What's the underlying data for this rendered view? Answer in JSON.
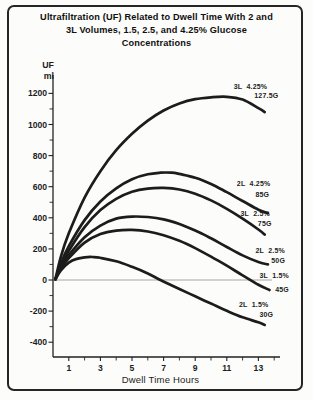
{
  "figure": {
    "title_lines": [
      "Ultrafiltration (UF) Related to Dwell Time With 2 and",
      "3L Volumes, 1.5, 2.5, and 4.25% Glucose",
      "Concentrations"
    ]
  },
  "chart_data": {
    "type": "line",
    "title": "Ultrafiltration (UF) Related to Dwell Time With 2 and 3L Volumes, 1.5, 2.5, and 4.25% Glucose Concentrations",
    "xlabel": "Dwell Time Hours",
    "ylabel": "UF ml",
    "ylabel_lines": [
      "UF",
      "ml"
    ],
    "xlim": [
      0,
      14.5
    ],
    "ylim": [
      -500,
      1320
    ],
    "x_major_ticks": [
      1,
      3,
      5,
      7,
      9,
      11,
      13
    ],
    "x_minor_ticks": [
      2,
      4,
      6,
      8,
      10,
      12,
      14
    ],
    "y_major_ticks": [
      1200,
      1000,
      800,
      600,
      400,
      200,
      0,
      -200,
      -400
    ],
    "y_minor_ticks": [
      1100,
      900,
      700,
      500,
      300,
      100,
      -100,
      -300
    ],
    "grid": false,
    "zero_line": true,
    "legend_position": "inline-labels",
    "colors": {
      "curve": "#1c1c1c",
      "axis": "#222222",
      "zero_line": "#8f8f8f",
      "text": "#1d1d1d",
      "background": "#fcfcfa"
    },
    "series": [
      {
        "id": "3l-4-25",
        "name": "3L 4.25% (127.5G)",
        "volume": "3L",
        "glucose_pct": "4.25%",
        "glucose_load": "127.5G",
        "label_lines": [
          "3L  4.25%",
          "127.5G"
        ],
        "label_pos": [
          [
            12.5,
            1245
          ],
          [
            13.5,
            1185
          ]
        ],
        "points": [
          [
            0.15,
            5
          ],
          [
            0.5,
            150
          ],
          [
            1,
            300
          ],
          [
            2,
            530
          ],
          [
            3,
            700
          ],
          [
            4,
            835
          ],
          [
            5,
            940
          ],
          [
            6,
            1025
          ],
          [
            7,
            1090
          ],
          [
            8,
            1135
          ],
          [
            9,
            1163
          ],
          [
            10,
            1175
          ],
          [
            11,
            1178
          ],
          [
            12,
            1160
          ],
          [
            13,
            1105
          ],
          [
            13.4,
            1080
          ]
        ]
      },
      {
        "id": "2l-4-25",
        "name": "2L 4.25% (85G)",
        "volume": "2L",
        "glucose_pct": "4.25%",
        "glucose_load": "85G",
        "label_lines": [
          "2L  4.25%",
          "85G"
        ],
        "label_pos": [
          [
            12.7,
            623
          ],
          [
            13.25,
            553
          ]
        ],
        "points": [
          [
            0.15,
            5
          ],
          [
            0.5,
            108
          ],
          [
            1,
            218
          ],
          [
            2,
            385
          ],
          [
            3,
            505
          ],
          [
            4,
            590
          ],
          [
            5,
            648
          ],
          [
            6,
            680
          ],
          [
            6.8,
            690
          ],
          [
            7.5,
            690
          ],
          [
            8,
            682
          ],
          [
            9,
            658
          ],
          [
            10,
            618
          ],
          [
            11,
            565
          ],
          [
            12,
            508
          ],
          [
            13,
            452
          ],
          [
            13.6,
            430
          ]
        ]
      },
      {
        "id": "3l-2-5",
        "name": "3L 2.5% (75G)",
        "volume": "3L",
        "glucose_pct": "2.5%",
        "glucose_load": "75G",
        "label_lines": [
          "3L  2.5%",
          "75G"
        ],
        "label_pos": [
          [
            12.8,
            430
          ],
          [
            13.4,
            364
          ]
        ],
        "points": [
          [
            0.15,
            5
          ],
          [
            0.5,
            92
          ],
          [
            1,
            188
          ],
          [
            2,
            340
          ],
          [
            3,
            450
          ],
          [
            4,
            522
          ],
          [
            5,
            568
          ],
          [
            6,
            588
          ],
          [
            7,
            592
          ],
          [
            8,
            582
          ],
          [
            9,
            555
          ],
          [
            10,
            512
          ],
          [
            11,
            458
          ],
          [
            12,
            395
          ],
          [
            13,
            325
          ],
          [
            13.4,
            292
          ]
        ]
      },
      {
        "id": "2l-2-5",
        "name": "2L 2.5% (50G)",
        "volume": "2L",
        "glucose_pct": "2.5%",
        "glucose_load": "50G",
        "label_lines": [
          "2L  2.5%",
          "50G"
        ],
        "label_pos": [
          [
            13.75,
            187
          ],
          [
            14.25,
            126
          ]
        ],
        "points": [
          [
            0.15,
            5
          ],
          [
            0.5,
            82
          ],
          [
            1,
            160
          ],
          [
            2,
            275
          ],
          [
            3,
            350
          ],
          [
            4,
            395
          ],
          [
            5,
            408
          ],
          [
            6,
            405
          ],
          [
            7,
            390
          ],
          [
            8,
            360
          ],
          [
            9,
            318
          ],
          [
            10,
            268
          ],
          [
            11,
            212
          ],
          [
            12,
            158
          ],
          [
            13,
            115
          ],
          [
            13.6,
            100
          ]
        ]
      },
      {
        "id": "3l-1-5",
        "name": "3L 1.5% (45G)",
        "volume": "3L",
        "glucose_pct": "1.5%",
        "glucose_load": "45G",
        "label_lines": [
          "3L  1.5%",
          "45G"
        ],
        "label_pos": [
          [
            14.0,
            32
          ],
          [
            14.5,
            -64
          ]
        ],
        "points": [
          [
            0.15,
            5
          ],
          [
            0.5,
            72
          ],
          [
            1,
            140
          ],
          [
            2,
            240
          ],
          [
            3,
            295
          ],
          [
            4,
            318
          ],
          [
            5,
            322
          ],
          [
            6,
            312
          ],
          [
            7,
            288
          ],
          [
            8,
            252
          ],
          [
            9,
            205
          ],
          [
            10,
            150
          ],
          [
            11,
            92
          ],
          [
            12,
            30
          ],
          [
            13,
            -30
          ],
          [
            13.7,
            -64
          ]
        ]
      },
      {
        "id": "2l-1-5",
        "name": "2L 1.5% (30G)",
        "volume": "2L",
        "glucose_pct": "1.5%",
        "glucose_load": "30G",
        "label_lines": [
          "2L  1.5%",
          "30G"
        ],
        "label_pos": [
          [
            12.7,
            -158
          ],
          [
            13.5,
            -224
          ]
        ],
        "points": [
          [
            0.15,
            5
          ],
          [
            0.5,
            62
          ],
          [
            1,
            112
          ],
          [
            1.5,
            136
          ],
          [
            2,
            146
          ],
          [
            2.5,
            148
          ],
          [
            3,
            143
          ],
          [
            4,
            120
          ],
          [
            5,
            85
          ],
          [
            6,
            42
          ],
          [
            6.8,
            0
          ],
          [
            8,
            -58
          ],
          [
            9,
            -105
          ],
          [
            10,
            -152
          ],
          [
            11,
            -198
          ],
          [
            12,
            -240
          ],
          [
            13,
            -272
          ],
          [
            13.4,
            -289
          ]
        ]
      }
    ]
  }
}
